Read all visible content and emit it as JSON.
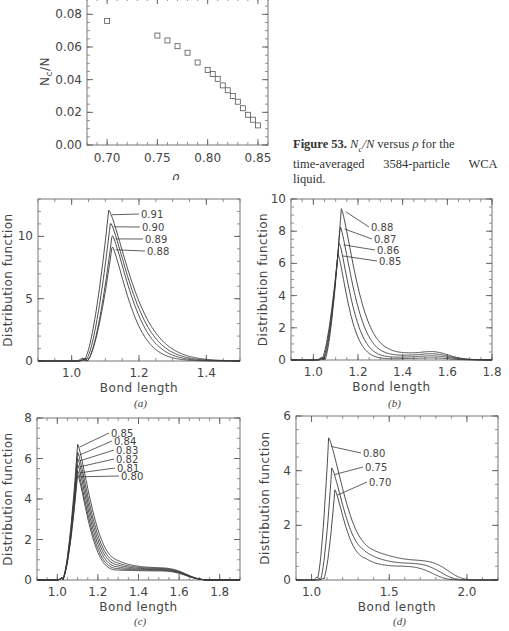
{
  "figure_53": {
    "caption_label": "Figure 53.",
    "caption_math": "N_c/N",
    "caption_text": "versus ρ for the time-averaged 3584-particle WCA liquid.",
    "caption_line1_rest": " versus ",
    "caption_rho": "ρ",
    "caption_line1_end": " for the",
    "caption_line2": "time-averaged      3584-particle      WCA",
    "caption_line3": "liquid."
  },
  "figure_54_sublabels": [
    "(a)",
    "(b)",
    "(c)",
    "(d)"
  ],
  "chart_data": [
    {
      "id": "nc-vs-rho",
      "type": "scatter",
      "title": "",
      "xlabel": "ρ",
      "ylabel": "Nc/N",
      "xlim": [
        0.68,
        0.86
      ],
      "ylim": [
        0.0,
        0.09
      ],
      "xticks": [
        "0.70",
        "0.75",
        "0.80",
        "0.85"
      ],
      "yticks": [
        "0.00",
        "0.02",
        "0.04",
        "0.06",
        "0.08"
      ],
      "marker": "open-square",
      "grid": false,
      "x": [
        0.7,
        0.75,
        0.76,
        0.77,
        0.78,
        0.79,
        0.8,
        0.805,
        0.81,
        0.815,
        0.82,
        0.825,
        0.83,
        0.835,
        0.84,
        0.845,
        0.85
      ],
      "y": [
        0.076,
        0.067,
        0.064,
        0.0605,
        0.0565,
        0.0505,
        0.046,
        0.0435,
        0.0405,
        0.0365,
        0.0335,
        0.03,
        0.0265,
        0.0225,
        0.0185,
        0.0155,
        0.012
      ]
    },
    {
      "id": "panel-a",
      "type": "line",
      "sublabel": "(a)",
      "xlabel": "Bond length",
      "ylabel": "Distribution function",
      "xlim": [
        0.9,
        1.5
      ],
      "ylim": [
        0,
        13
      ],
      "xticks": [
        "1.0",
        "1.2",
        "1.4"
      ],
      "yticks": [
        "0",
        "5",
        "10"
      ],
      "legend_labels": [
        "0.91",
        "0.90",
        "0.89",
        "0.88"
      ],
      "series": [
        {
          "name": "0.91",
          "peak_x": 1.11,
          "peak_y": 12.1
        },
        {
          "name": "0.90",
          "peak_x": 1.115,
          "peak_y": 11.1
        },
        {
          "name": "0.89",
          "peak_x": 1.12,
          "peak_y": 10.1
        },
        {
          "name": "0.88",
          "peak_x": 1.12,
          "peak_y": 9.2
        }
      ]
    },
    {
      "id": "panel-b",
      "type": "line",
      "sublabel": "(b)",
      "xlabel": "Bond length",
      "ylabel": "Distribution function",
      "xlim": [
        0.9,
        1.8
      ],
      "ylim": [
        0,
        10
      ],
      "xticks": [
        "1.0",
        "1.2",
        "1.4",
        "1.6",
        "1.8"
      ],
      "yticks": [
        "0",
        "2",
        "4",
        "6",
        "8",
        "10"
      ],
      "legend_labels": [
        "0.88",
        "0.87",
        "0.86",
        "0.85"
      ],
      "series": [
        {
          "name": "0.88",
          "peak_x": 1.125,
          "peak_y": 9.4
        },
        {
          "name": "0.87",
          "peak_x": 1.12,
          "peak_y": 8.3
        },
        {
          "name": "0.86",
          "peak_x": 1.115,
          "peak_y": 7.3
        },
        {
          "name": "0.85",
          "peak_x": 1.11,
          "peak_y": 6.6
        }
      ]
    },
    {
      "id": "panel-c",
      "type": "line",
      "sublabel": "(c)",
      "xlabel": "Bond length",
      "ylabel": "Distribution function",
      "xlim": [
        0.9,
        1.9
      ],
      "ylim": [
        0,
        8
      ],
      "xticks": [
        "1.0",
        "1.2",
        "1.4",
        "1.6",
        "1.8"
      ],
      "yticks": [
        "0",
        "2",
        "4",
        "6",
        "8"
      ],
      "legend_labels": [
        "0.85",
        "0.84",
        "0.83",
        "0.82",
        "0.81",
        "0.80"
      ],
      "series": [
        {
          "name": "0.85",
          "peak_x": 1.1,
          "peak_y": 6.7
        },
        {
          "name": "0.84",
          "peak_x": 1.1,
          "peak_y": 6.3
        },
        {
          "name": "0.83",
          "peak_x": 1.1,
          "peak_y": 6.0
        },
        {
          "name": "0.82",
          "peak_x": 1.1,
          "peak_y": 5.7
        },
        {
          "name": "0.81",
          "peak_x": 1.1,
          "peak_y": 5.4
        },
        {
          "name": "0.80",
          "peak_x": 1.1,
          "peak_y": 5.2
        }
      ]
    },
    {
      "id": "panel-d",
      "type": "line",
      "sublabel": "(d)",
      "xlabel": "Bond length",
      "ylabel": "Distribution function",
      "xlim": [
        0.9,
        2.2
      ],
      "ylim": [
        0,
        6
      ],
      "xticks": [
        "1.0",
        "1.5",
        "2.0"
      ],
      "yticks": [
        "0",
        "2",
        "4",
        "6"
      ],
      "legend_labels": [
        "0.80",
        "0.75",
        "0.70"
      ],
      "series": [
        {
          "name": "0.80",
          "peak_x": 1.11,
          "peak_y": 5.2
        },
        {
          "name": "0.75",
          "peak_x": 1.13,
          "peak_y": 4.1
        },
        {
          "name": "0.70",
          "peak_x": 1.15,
          "peak_y": 3.3
        }
      ]
    }
  ]
}
